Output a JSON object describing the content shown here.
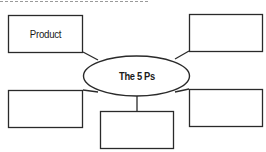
{
  "diagram": {
    "center": {
      "label": "The 5 Ps"
    },
    "boxes": [
      {
        "position": "top-left",
        "label": "Product"
      },
      {
        "position": "top-right",
        "label": ""
      },
      {
        "position": "bottom-left",
        "label": ""
      },
      {
        "position": "bottom-center",
        "label": ""
      },
      {
        "position": "bottom-right",
        "label": ""
      }
    ],
    "colors": {
      "stroke": "#2a2a2a",
      "dash": "#9a9a9a",
      "background": "#ffffff"
    }
  }
}
